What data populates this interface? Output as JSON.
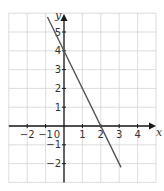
{
  "chart_data": {
    "type": "line",
    "title": "",
    "xlabel": "x",
    "ylabel": "y",
    "xlim": [
      -3,
      5
    ],
    "ylim": [
      -3,
      6
    ],
    "grid": true,
    "x_ticks": [
      -2,
      -1,
      0,
      1,
      2,
      3,
      4
    ],
    "x_tick_labels": [
      "−2",
      "−1",
      "0",
      "1",
      "2",
      "3",
      "4"
    ],
    "y_ticks": [
      -2,
      -1,
      1,
      2,
      3,
      4,
      5
    ],
    "y_tick_labels": [
      "−2",
      "−1",
      "1",
      "2",
      "3",
      "4",
      "5"
    ],
    "origin_label": "0",
    "series": [
      {
        "name": "y = -2x + 4",
        "x": [
          -0.9,
          3.1
        ],
        "y": [
          5.8,
          -2.2
        ],
        "color": "#555555"
      }
    ],
    "intercepts": {
      "x_intercept": 2,
      "y_intercept": 4
    }
  },
  "colors": {
    "grid": "#d4d4d4",
    "axis": "#1a1a1a",
    "line": "#555555",
    "text": "#333333"
  }
}
